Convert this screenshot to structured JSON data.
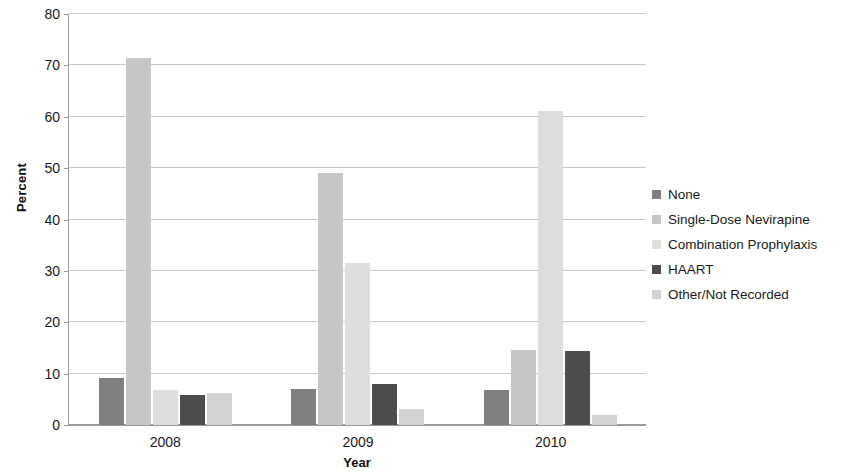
{
  "chart_data": {
    "type": "bar",
    "title": "",
    "xlabel": "Year",
    "ylabel": "Percent",
    "categories": [
      "2008",
      "2009",
      "2010"
    ],
    "ylim": [
      0,
      80
    ],
    "yticks": [
      0,
      10,
      20,
      30,
      40,
      50,
      60,
      70,
      80
    ],
    "ytick_labels": [
      "0",
      "10",
      "20",
      "30",
      "40",
      "50",
      "60",
      "70",
      "80"
    ],
    "grid": true,
    "legend_position": "right",
    "series": [
      {
        "name": "None",
        "color": "#7f7f7f",
        "values": [
          9.2,
          7.0,
          6.8
        ]
      },
      {
        "name": "Single-Dose Nevirapine",
        "color": "#c6c6c6",
        "values": [
          71.2,
          49.0,
          14.5
        ]
      },
      {
        "name": "Combination Prophylaxis",
        "color": "#dedede",
        "values": [
          6.8,
          31.5,
          61.0
        ]
      },
      {
        "name": "HAART",
        "color": "#4d4d4d",
        "values": [
          5.8,
          8.0,
          14.3
        ]
      },
      {
        "name": "Other/Not Recorded",
        "color": "#d2d2d2",
        "values": [
          6.2,
          3.2,
          1.9
        ]
      }
    ]
  },
  "legend": {
    "items": [
      {
        "label": "None",
        "swatch_color": "#7f7f7f",
        "icon": "legend-square-icon"
      },
      {
        "label": "Single-Dose Nevirapine",
        "swatch_color": "#c6c6c6",
        "icon": "legend-square-icon"
      },
      {
        "label": "Combination Prophylaxis",
        "swatch_color": "#dedede",
        "icon": "legend-square-icon"
      },
      {
        "label": "HAART",
        "swatch_color": "#4d4d4d",
        "icon": "legend-square-icon"
      },
      {
        "label": "Other/Not Recorded",
        "swatch_color": "#d2d2d2",
        "icon": "legend-square-icon"
      }
    ]
  },
  "axes": {
    "y_title": "Percent",
    "x_title": "Year"
  }
}
